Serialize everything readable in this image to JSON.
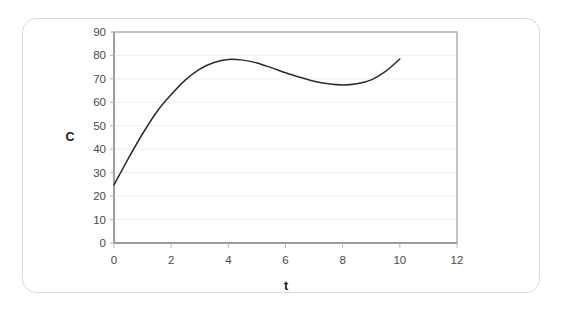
{
  "figure": {
    "frame_color": "#d9d9d9",
    "background": "#ffffff"
  },
  "chart_data": {
    "type": "line",
    "title": "",
    "subtitle": "",
    "xlabel": "t",
    "ylabel": "C",
    "xlim": [
      0,
      12
    ],
    "ylim": [
      0,
      90
    ],
    "xticks": [
      0,
      2,
      4,
      6,
      8,
      10,
      12
    ],
    "yticks": [
      0,
      10,
      20,
      30,
      40,
      50,
      60,
      70,
      80,
      90
    ],
    "xtick_labels": [
      "0",
      "2",
      "4",
      "6",
      "8",
      "10",
      "12"
    ],
    "ytick_labels": [
      "0",
      "10",
      "20",
      "30",
      "40",
      "50",
      "60",
      "70",
      "80",
      "90"
    ],
    "grid": "horizontal",
    "legend": "none",
    "annotations": [],
    "series": [
      {
        "name": "C(t)",
        "color": "#2b2b2b",
        "x": [
          0,
          0.5,
          1,
          1.5,
          2,
          2.5,
          3,
          3.5,
          4,
          4.5,
          5,
          5.5,
          6,
          6.5,
          7,
          7.5,
          8,
          8.5,
          9,
          9.5,
          10
        ],
        "values": [
          24.8,
          36.0,
          46.6,
          56.0,
          63.3,
          69.6,
          74.2,
          77.0,
          78.3,
          78.0,
          76.8,
          74.8,
          72.6,
          70.7,
          69.0,
          67.9,
          67.4,
          67.9,
          69.6,
          73.2,
          78.5
        ]
      }
    ],
    "features": {
      "start_point": {
        "t": 0,
        "C": 24.8
      },
      "local_maximum": {
        "t": 4,
        "C": 78.3
      },
      "local_minimum": {
        "t": 8,
        "C": 67.4
      },
      "end_point": {
        "t": 10,
        "C": 78.5
      }
    }
  }
}
